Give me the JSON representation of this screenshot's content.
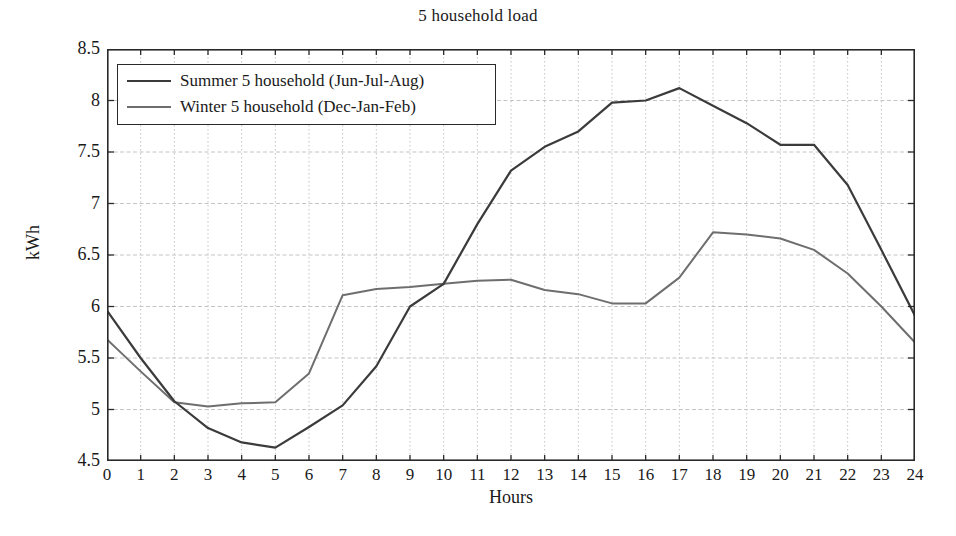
{
  "chart_data": {
    "type": "line",
    "title": "5 household load",
    "xlabel": "Hours",
    "ylabel": "kWh",
    "xlim": [
      0,
      24
    ],
    "ylim": [
      4.5,
      8.5
    ],
    "ytick_step": 0.5,
    "xtick_step": 1,
    "grid": true,
    "legend_position": "top-left",
    "x": [
      0,
      1,
      2,
      3,
      4,
      5,
      6,
      7,
      8,
      9,
      10,
      11,
      12,
      13,
      14,
      15,
      16,
      17,
      18,
      19,
      20,
      21,
      22,
      23,
      24
    ],
    "xticklabels": [
      "0",
      "1",
      "2",
      "3",
      "4",
      "5",
      "6",
      "7",
      "8",
      "9",
      "10",
      "11",
      "12",
      "13",
      "14",
      "15",
      "16",
      "17",
      "18",
      "19",
      "20",
      "21",
      "22",
      "23",
      "24"
    ],
    "yticklabels": [
      "4.5",
      "5",
      "5.5",
      "6",
      "6.5",
      "7",
      "7.5",
      "8",
      "8.5"
    ],
    "yticks": [
      4.5,
      5,
      5.5,
      6,
      6.5,
      7,
      7.5,
      8,
      8.5
    ],
    "series": [
      {
        "name": "Summer 5 household (Jun-Jul-Aug)",
        "color": "#3b3b3b",
        "width": 2.2,
        "values": [
          5.96,
          5.5,
          5.08,
          4.82,
          4.68,
          4.63,
          4.83,
          5.04,
          5.42,
          6.0,
          6.22,
          6.8,
          7.32,
          7.55,
          7.7,
          7.98,
          8.0,
          8.12,
          7.95,
          7.78,
          7.57,
          7.57,
          7.18,
          6.55,
          5.91
        ]
      },
      {
        "name": "Winter 5 household (Dec-Jan-Feb)",
        "color": "#6e6e6e",
        "width": 2.0,
        "values": [
          5.68,
          5.37,
          5.07,
          5.03,
          5.06,
          5.07,
          5.35,
          6.11,
          6.17,
          6.19,
          6.22,
          6.25,
          6.26,
          6.16,
          6.12,
          6.03,
          6.03,
          6.28,
          6.72,
          6.7,
          6.66,
          6.55,
          6.32,
          6.0,
          5.65
        ]
      }
    ],
    "axis_color": "#2a2a2a",
    "grid_color": "#c4c4c4",
    "background": "#ffffff"
  }
}
